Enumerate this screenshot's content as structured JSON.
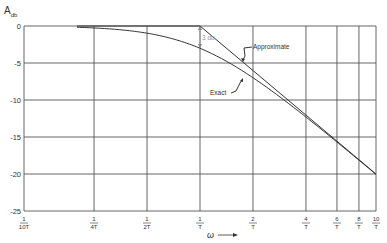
{
  "chart_data": {
    "type": "line",
    "title": "",
    "ylabel": "A",
    "ylabel_subscript": "db",
    "xlabel": "ω",
    "xscale": "log",
    "ylim": [
      -25,
      0
    ],
    "xlim_omegaT": [
      0.1,
      10
    ],
    "grid": true,
    "legend": "annotations",
    "y_ticks": [
      0,
      -5,
      -10,
      -15,
      -20,
      -25
    ],
    "y_tick_labels": [
      "0",
      "-5",
      "-10",
      "-15",
      "-20",
      "-25"
    ],
    "x_ticks_omegaT": [
      0.1,
      0.25,
      0.5,
      1,
      2,
      4,
      6,
      8,
      10
    ],
    "x_tick_labels": [
      {
        "num": "1",
        "den": "10T"
      },
      {
        "num": "1",
        "den": "4T"
      },
      {
        "num": "1",
        "den": "2T"
      },
      {
        "num": "1",
        "den": "T"
      },
      {
        "num": "2",
        "den": "T"
      },
      {
        "num": "4",
        "den": "T"
      },
      {
        "num": "6",
        "den": "T"
      },
      {
        "num": "8",
        "den": "T"
      },
      {
        "num": "10",
        "den": "T"
      }
    ],
    "series": [
      {
        "name": "Exact",
        "x_omegaT": [
          0.2,
          0.25,
          0.5,
          1,
          2,
          4,
          6,
          8,
          10
        ],
        "values": [
          -0.17,
          -0.26,
          -0.97,
          -3.01,
          -6.99,
          -12.3,
          -15.7,
          -18.1,
          -20.0
        ]
      },
      {
        "name": "Approximate",
        "x_omegaT": [
          0.2,
          0.25,
          0.5,
          1,
          2,
          4,
          6,
          8,
          10
        ],
        "values": [
          0,
          0,
          0,
          0,
          -6.02,
          -12.04,
          -15.56,
          -18.06,
          -20.0
        ]
      }
    ],
    "annotations": [
      {
        "text": "Approximate",
        "points_to": "asymptote near ω = 1.6/T"
      },
      {
        "text": "Exact",
        "points_to": "exact curve near ω = 1.6/T"
      },
      {
        "text": "3 db",
        "at": "ω = 1/T, gap between 0 dB and exact curve"
      }
    ]
  },
  "labels": {
    "y_axis": "A",
    "y_axis_sub": "db",
    "x_axis": "ω",
    "approx": "Approximate",
    "exact": "Exact",
    "gap": "3 db"
  }
}
